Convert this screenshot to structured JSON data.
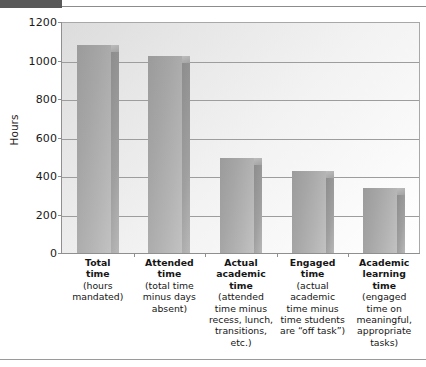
{
  "decor": {
    "top_tab": "dark-tab",
    "top_rule": "horizontal-rule",
    "bottom_rule": "horizontal-rule"
  },
  "chart_data": {
    "type": "bar",
    "title": "",
    "xlabel": "",
    "ylabel": "Hours",
    "ylim": [
      0,
      1200
    ],
    "ytick_values": [
      1200,
      1000,
      800,
      600,
      400,
      200,
      0
    ],
    "ytick_labels": [
      "1200",
      "1000",
      "800",
      "600",
      "400",
      "200",
      "0"
    ],
    "grid": true,
    "legend": "none",
    "categories": [
      "Total time (hours mandated)",
      "Attended time (total time minus days absent)",
      "Actual academic time (attended time minus recess, lunch, transitions, etc.)",
      "Engaged time (actual academic time minus time students are “off task”)",
      "Academic learning time (engaged time on meaningful, appropriate tasks)"
    ],
    "values": [
      1080,
      1025,
      495,
      425,
      340
    ],
    "bars": [
      {
        "heading_lines": [
          "Total",
          "time"
        ],
        "sub_lines": [
          "(hours",
          "mandated)"
        ],
        "value": 1080
      },
      {
        "heading_lines": [
          "Attended",
          "time"
        ],
        "sub_lines": [
          "(total time",
          "minus days",
          "absent)"
        ],
        "value": 1025
      },
      {
        "heading_lines": [
          "Actual",
          "academic",
          "time"
        ],
        "sub_lines": [
          "(attended",
          "time minus",
          "recess, lunch,",
          "transitions,",
          "etc.)"
        ],
        "value": 495
      },
      {
        "heading_lines": [
          "Engaged",
          "time"
        ],
        "sub_lines": [
          "(actual",
          "academic",
          "time minus",
          "time students",
          "are “off task”)"
        ],
        "value": 425
      },
      {
        "heading_lines": [
          "Academic",
          "learning",
          "time"
        ],
        "sub_lines": [
          "(engaged",
          "time on",
          "meaningful,",
          "appropriate",
          "tasks)"
        ],
        "value": 340
      }
    ],
    "colors": {
      "bar_face": "#a8a8a8",
      "bar_side": "#949494",
      "gridline": "#9d9d9d",
      "axis": "#8f8f8f",
      "plot_bg": "#eeeeee",
      "text": "#161616",
      "accent_tab": "#595959"
    }
  }
}
